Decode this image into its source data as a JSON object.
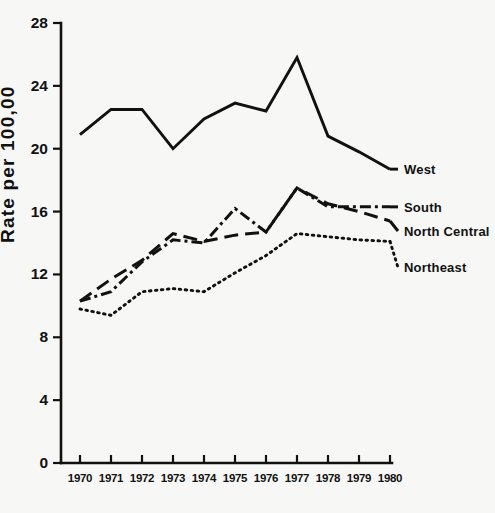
{
  "chart_data": {
    "type": "line",
    "title": "",
    "subtitle": "",
    "xlabel": "",
    "ylabel": "Rate per 100,00",
    "categories": [
      "1970",
      "1971",
      "1972",
      "1973",
      "1974",
      "1975",
      "1976",
      "1977",
      "1978",
      "1979",
      "1980"
    ],
    "x": [
      1970,
      1971,
      1972,
      1973,
      1974,
      1975,
      1976,
      1977,
      1978,
      1979,
      1980
    ],
    "xlim": [
      1970,
      1980
    ],
    "ylim": [
      0,
      28
    ],
    "y_ticks": [
      "0",
      "4",
      "8",
      "12",
      "16",
      "20",
      "24",
      "28"
    ],
    "y_tick_values": [
      0,
      4,
      8,
      12,
      16,
      20,
      24,
      28
    ],
    "grid": false,
    "legend_position": "right-inline",
    "series": [
      {
        "name": "West",
        "style": "solid",
        "color": "#111111",
        "values": [
          20.9,
          22.5,
          22.5,
          20.0,
          21.9,
          22.9,
          22.4,
          25.8,
          20.8,
          19.8,
          18.7
        ]
      },
      {
        "name": "South",
        "style": "dash-dot",
        "color": "#111111",
        "values": [
          10.3,
          10.9,
          12.8,
          14.2,
          14.0,
          16.2,
          14.7,
          17.5,
          16.3,
          16.3,
          16.3
        ]
      },
      {
        "name": "North Central",
        "style": "long-dash",
        "color": "#111111",
        "values": [
          10.3,
          11.7,
          12.9,
          14.6,
          14.1,
          14.5,
          14.7,
          17.5,
          16.5,
          16.0,
          15.4
        ]
      },
      {
        "name": "Northeast",
        "style": "dotted",
        "color": "#111111",
        "values": [
          9.8,
          9.4,
          10.9,
          11.1,
          10.9,
          12.1,
          13.2,
          14.6,
          14.4,
          14.2,
          14.1
        ]
      }
    ]
  },
  "legend": {
    "entries": [
      {
        "label": "West",
        "style": "solid"
      },
      {
        "label": "South",
        "style": "dash-dot"
      },
      {
        "label": "North Central",
        "style": "long-dash"
      },
      {
        "label": "Northeast",
        "style": "dotted"
      }
    ]
  },
  "axes": {
    "y_title": "Rate per 100,00",
    "y_tick_labels": [
      "28",
      "24",
      "20",
      "16",
      "12",
      "8",
      "4",
      "0"
    ],
    "x_tick_labels": [
      "1970",
      "1971",
      "1972",
      "1973",
      "1974",
      "1975",
      "1976",
      "1977",
      "1978",
      "1979",
      "1980"
    ]
  },
  "colors": {
    "ink": "#111111",
    "background": "#f7f7f6"
  }
}
